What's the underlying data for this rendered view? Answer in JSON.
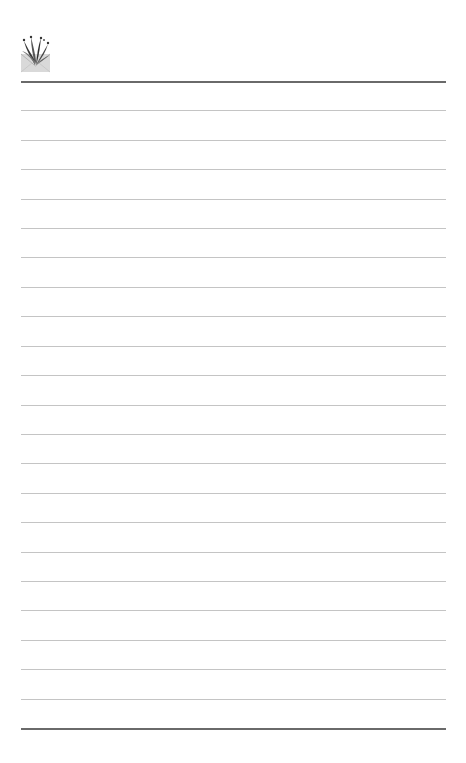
{
  "page": {
    "type": "lined-stationery",
    "logo": {
      "icon": "envelope-bouquet-icon"
    },
    "rules": {
      "top_y": 81,
      "bottom_y": 728,
      "thin_count": 21,
      "left_x": 21,
      "right_x": 446,
      "heavy_color": "#6a6a6a",
      "thin_color": "#c4c4c4"
    }
  }
}
